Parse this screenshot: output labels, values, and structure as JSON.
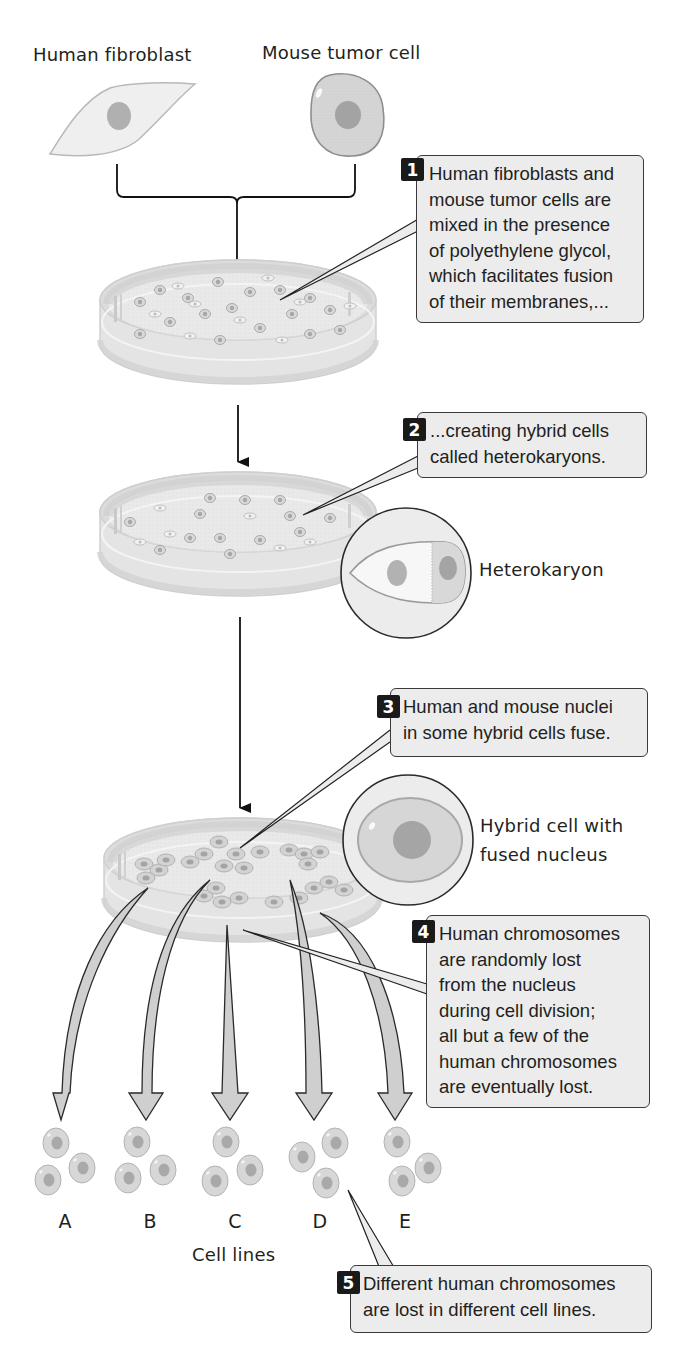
{
  "title_labels": {
    "human_fibroblast": "Human fibroblast",
    "mouse_tumor_cell": "Mouse tumor cell",
    "heterokaryon": "Heterokaryon",
    "hybrid_cell": [
      "Hybrid cell with",
      "fused nucleus"
    ],
    "cell_lines": "Cell lines"
  },
  "steps": [
    {
      "number": "1",
      "lines": [
        "Human fibroblasts and",
        "mouse tumor cells are",
        "mixed in the presence",
        "of polyethylene glycol,",
        "which facilitates fusion",
        "of their membranes,..."
      ]
    },
    {
      "number": "2",
      "lines": [
        "...creating hybrid cells",
        "called heterokaryons."
      ]
    },
    {
      "number": "3",
      "lines": [
        "Human and mouse nuclei",
        "in some hybrid cells fuse."
      ]
    },
    {
      "number": "4",
      "lines": [
        "Human chromosomes",
        "are randomly lost",
        "from the nucleus",
        "during cell division;",
        "all but a few of the",
        "human chromosomes",
        "are eventually lost."
      ]
    },
    {
      "number": "5",
      "lines": [
        "Different human chromosomes",
        "are lost in different cell lines."
      ]
    }
  ],
  "cell_line_letters": [
    "A",
    "B",
    "C",
    "D",
    "E"
  ],
  "colors": {
    "callout_fill": "#ececec",
    "callout_border": "#3a3a3a",
    "badge": "#1a1a1a",
    "cell_fill": "#d6d6d6",
    "nucleus": "#a9a9a9",
    "dish": "#e6e6e6"
  }
}
